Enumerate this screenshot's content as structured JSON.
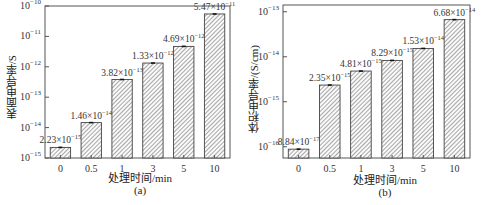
{
  "chart_data": [
    {
      "type": "bar",
      "panel": "(a)",
      "title": "",
      "xlabel": "处理时间/min",
      "ylabel": "表面电导率/S",
      "yscale": "log",
      "ylim": [
        1e-15,
        1e-10
      ],
      "yticks": [
        "10^-15",
        "10^-14",
        "10^-13",
        "10^-12",
        "10^-11",
        "10^-10"
      ],
      "categories": [
        "0",
        "0.5",
        "1",
        "3",
        "5",
        "10"
      ],
      "values": [
        2.23e-15,
        1.46e-14,
        3.82e-13,
        1.33e-12,
        4.69e-12,
        5.47e-11
      ],
      "data_labels": [
        {
          "m": "2.23×10",
          "e": "−15"
        },
        {
          "m": "1.46×10",
          "e": "−14"
        },
        {
          "m": "3.82×10",
          "e": "−13"
        },
        {
          "m": "1.33×10",
          "e": "−12"
        },
        {
          "m": "4.69×10",
          "e": "−12"
        },
        {
          "m": "5.47×10",
          "e": "−11"
        }
      ],
      "bar_pattern": "diagonal-hatch",
      "grid": false,
      "legend": null
    },
    {
      "type": "bar",
      "panel": "(b)",
      "title": "",
      "xlabel": "处理时间/min",
      "ylabel": "体积电导率/(S/cm)",
      "yscale": "log",
      "ylim": [
        5e-17,
        2e-13
      ],
      "yticks": [
        "10^-16",
        "10^-15",
        "10^-14",
        "10^-13"
      ],
      "categories": [
        "0",
        "0.5",
        "1",
        "3",
        "5",
        "10"
      ],
      "values": [
        8.84e-17,
        2.35e-15,
        4.81e-15,
        8.29e-15,
        1.53e-14,
        6.68e-14
      ],
      "data_labels": [
        {
          "m": "8.84×10",
          "e": "−17"
        },
        {
          "m": "2.35×10",
          "e": "−15"
        },
        {
          "m": "4.81×10",
          "e": "−15"
        },
        {
          "m": "8.29×10",
          "e": "−15"
        },
        {
          "m": "1.53×10",
          "e": "−14"
        },
        {
          "m": "6.68×10",
          "e": "−14"
        }
      ],
      "bar_pattern": "diagonal-hatch",
      "grid": false,
      "legend": null
    }
  ],
  "panels": {
    "a": {
      "ylabel": "表面电导率/S",
      "xlabel": "处理时间/min",
      "caption": "(a)"
    },
    "b": {
      "ylabel": "体积电导率/(S/cm)",
      "xlabel": "处理时间/min",
      "caption": "(b)"
    }
  }
}
